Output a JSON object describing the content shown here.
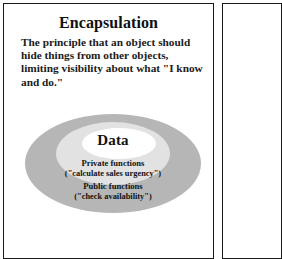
{
  "slide": {
    "title": "Encapsulation",
    "body": "The principle that an object should hide things from other objects, limiting visibility about what \"I know and do.\"",
    "diagram": {
      "type": "concentric-ellipses",
      "rings": [
        {
          "name": "public",
          "label": "Public functions",
          "sublabel": "(\"check availability\")",
          "color": "#b6b6b6"
        },
        {
          "name": "private",
          "label": "Private functions",
          "sublabel": "(\"calculate sales urgency\")",
          "color": "#e2e2e2"
        },
        {
          "name": "data",
          "label": "Data",
          "sublabel": "",
          "color": "#ffffff"
        }
      ]
    }
  },
  "colors": {
    "panel_border": "#1a1a1a",
    "page_background": "#ffffff",
    "text": "#121212"
  }
}
